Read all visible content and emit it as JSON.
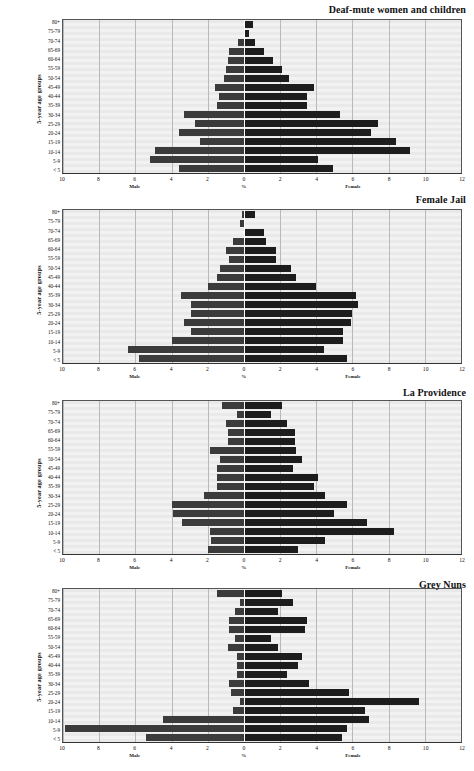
{
  "figure": {
    "axis_caption_y": "5-year age groups",
    "x_ticks": [
      {
        "label": "10",
        "value": -10
      },
      {
        "label": "8",
        "value": -8
      },
      {
        "label": "6",
        "value": -6
      },
      {
        "label": "4",
        "value": -4
      },
      {
        "label": "2",
        "value": -2
      },
      {
        "label": "0",
        "value": 0
      },
      {
        "label": "2",
        "value": 2
      },
      {
        "label": "4",
        "value": 4
      },
      {
        "label": "6",
        "value": 6
      },
      {
        "label": "8",
        "value": 8
      },
      {
        "label": "10",
        "value": 10
      },
      {
        "label": "12",
        "value": 12
      }
    ],
    "x_captions": {
      "left": "Male",
      "center": "%",
      "right": "Female"
    },
    "age_groups": [
      "80+",
      "75-79",
      "70-74",
      "65-69",
      "60-64",
      "55-59",
      "50-54",
      "45-49",
      "40-44",
      "35-39",
      "30-34",
      "25-29",
      "20-24",
      "15-19",
      "10-14",
      "5-9",
      "< 5"
    ],
    "colors": {
      "male_bar": "#3b3b3b",
      "female_bar": "#1d1d1d",
      "plot_bg": "#eeeeee",
      "gridline": "#b9b9b9",
      "zero_line": "#ffffff"
    }
  },
  "chart_data": [
    {
      "type": "bar",
      "title": "Deaf-mute women and children",
      "xlabel": "%",
      "ylabel": "5-year age groups",
      "xlim": [
        -10,
        12
      ],
      "grid": true,
      "categories": [
        "80+",
        "75-79",
        "70-74",
        "65-69",
        "60-64",
        "55-59",
        "50-54",
        "45-49",
        "40-44",
        "35-39",
        "30-34",
        "25-29",
        "20-24",
        "15-19",
        "10-14",
        "5-9",
        "< 5"
      ],
      "series": [
        {
          "name": "Male",
          "values": [
            0.0,
            0.0,
            0.3,
            0.8,
            0.9,
            1.0,
            1.1,
            1.6,
            1.4,
            1.5,
            3.3,
            2.7,
            3.6,
            2.4,
            4.9,
            5.2,
            3.6
          ]
        },
        {
          "name": "Female",
          "values": [
            0.5,
            0.3,
            0.6,
            1.1,
            1.6,
            2.1,
            2.5,
            3.9,
            3.5,
            3.5,
            5.3,
            7.4,
            7.0,
            8.4,
            9.2,
            4.1,
            4.9
          ]
        }
      ]
    },
    {
      "type": "bar",
      "title": "Female Jail",
      "xlabel": "%",
      "ylabel": "5-year age groups",
      "xlim": [
        -10,
        12
      ],
      "grid": true,
      "categories": [
        "80+",
        "75-79",
        "70-74",
        "65-69",
        "60-64",
        "55-59",
        "50-54",
        "45-49",
        "40-44",
        "35-39",
        "30-34",
        "25-29",
        "20-24",
        "15-19",
        "10-14",
        "5-9",
        "< 5"
      ],
      "series": [
        {
          "name": "Male",
          "values": [
            0.1,
            0.2,
            0.0,
            0.6,
            1.0,
            0.8,
            1.3,
            1.5,
            2.0,
            3.5,
            2.9,
            2.9,
            3.3,
            2.9,
            4.0,
            6.4,
            5.8
          ]
        },
        {
          "name": "Female",
          "values": [
            0.6,
            0.0,
            1.1,
            1.2,
            1.8,
            1.8,
            2.6,
            2.9,
            4.0,
            6.2,
            6.3,
            6.0,
            5.9,
            5.5,
            5.5,
            4.4,
            5.7
          ]
        }
      ]
    },
    {
      "type": "bar",
      "title": "La Providence",
      "xlabel": "%",
      "ylabel": "5-year age groups",
      "xlim": [
        -10,
        12
      ],
      "grid": true,
      "categories": [
        "80+",
        "75-79",
        "70-74",
        "65-69",
        "60-64",
        "55-59",
        "50-54",
        "45-49",
        "40-44",
        "35-39",
        "30-34",
        "25-29",
        "20-24",
        "15-19",
        "10-14",
        "5-9",
        "< 5"
      ],
      "series": [
        {
          "name": "Male",
          "values": [
            1.2,
            0.4,
            1.0,
            0.9,
            0.9,
            1.9,
            1.3,
            1.5,
            1.5,
            1.5,
            2.2,
            4.0,
            3.9,
            3.4,
            1.9,
            1.8,
            2.0
          ]
        },
        {
          "name": "Female",
          "values": [
            2.1,
            1.5,
            2.4,
            2.8,
            2.8,
            2.9,
            3.2,
            2.7,
            4.1,
            3.9,
            4.5,
            5.7,
            5.0,
            6.8,
            8.3,
            4.5,
            3.0
          ]
        }
      ]
    },
    {
      "type": "bar",
      "title": "Grey Nuns",
      "xlabel": "%",
      "ylabel": "5-year age groups",
      "xlim": [
        -10,
        12
      ],
      "grid": true,
      "categories": [
        "80+",
        "75-79",
        "70-74",
        "65-69",
        "60-64",
        "55-59",
        "50-54",
        "45-49",
        "40-44",
        "35-39",
        "30-34",
        "25-29",
        "20-24",
        "15-19",
        "10-14",
        "5-9",
        "< 5"
      ],
      "series": [
        {
          "name": "Male",
          "values": [
            1.5,
            0.2,
            0.5,
            0.8,
            0.8,
            0.5,
            0.9,
            0.4,
            0.4,
            0.4,
            0.8,
            0.7,
            0.2,
            0.6,
            4.5,
            9.9,
            5.4
          ]
        },
        {
          "name": "Female",
          "values": [
            2.1,
            2.7,
            1.9,
            3.5,
            3.4,
            1.5,
            1.9,
            3.2,
            3.0,
            2.4,
            3.6,
            5.8,
            9.7,
            6.7,
            6.9,
            5.7,
            5.4
          ]
        }
      ]
    }
  ]
}
